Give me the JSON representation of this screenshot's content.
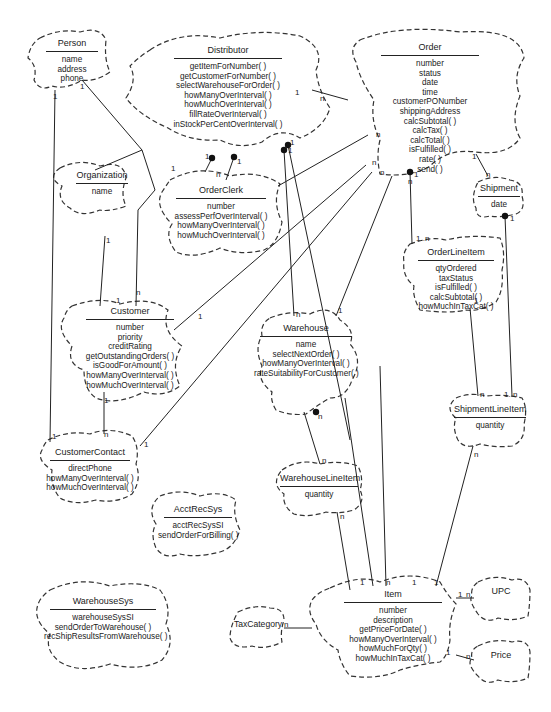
{
  "diagram": {
    "type": "class-diagram-clouds",
    "classes": {
      "person": {
        "name": "Person",
        "members": [
          "name",
          "address",
          "phone"
        ]
      },
      "distributor": {
        "name": "Distributor",
        "members": [
          "getItemForNumber( )",
          "getCustomerForNumber( )",
          "selectWarehouseForOrder( )",
          "howManyOverInterval( )",
          "howMuchOverInterval( )",
          "fillRateOverInterval( )",
          "inStockPerCentOverInterval( )"
        ]
      },
      "order": {
        "name": "Order",
        "members": [
          "number",
          "status",
          "date",
          "time",
          "customerPONumber",
          "shippingAddress",
          "calcSubtotal( )",
          "calcTax( )",
          "calcTotal( )",
          "isFulfilled( )",
          "rate( )",
          "send( )"
        ]
      },
      "organization": {
        "name": "Organization",
        "members": [
          "name"
        ]
      },
      "orderclerk": {
        "name": "OrderClerk",
        "members": [
          "number",
          "assessPerfOverInterval( )",
          "howManyOverInterval( )",
          "howMuchOverInterval( )"
        ]
      },
      "shipment": {
        "name": "Shipment",
        "members": [
          "date"
        ]
      },
      "orderlineitem": {
        "name": "OrderLineItem",
        "members": [
          "qtyOrdered",
          "taxStatus",
          "isFulfilled( )",
          "calcSubtotal( )",
          "howMuchInTaxCat( )"
        ]
      },
      "customer": {
        "name": "Customer",
        "members": [
          "number",
          "priority",
          "creditRating",
          "getOutstandingOrders( )",
          "isGoodForAmount( )",
          "howManyOverInterval( )",
          "howMuchOverInterval( )"
        ]
      },
      "warehouse": {
        "name": "Warehouse",
        "members": [
          "name",
          "selectNextOrder( )",
          "howManyOverInterval( )",
          "rateSuitabilityForCustomer( )"
        ]
      },
      "shipmentlineitem": {
        "name": "ShipmentLineItem",
        "members": [
          "quantity"
        ]
      },
      "customercontact": {
        "name": "CustomerContact",
        "members": [
          "directPhone",
          "howManyOverInterval( )",
          "howMuchOverInterval( )"
        ]
      },
      "warehouselineitem": {
        "name": "WarehouseLineItem",
        "members": [
          "quantity"
        ]
      },
      "acctrecsys": {
        "name": "AcctRecSys",
        "members": [
          "acctRecSysSI",
          "sendOrderForBilling( )"
        ]
      },
      "warehousesys": {
        "name": "WarehouseSys",
        "members": [
          "warehouseSysSI",
          "sendOrderToWarehouse( )",
          "recShipResultsFromWarehouse( )"
        ]
      },
      "item": {
        "name": "Item",
        "members": [
          "number",
          "description",
          "getPriceForDate( )",
          "howManyOverInterval( )",
          "howMuchForQty( )",
          "howMuchInTaxCat( )"
        ]
      },
      "taxcategory": {
        "name": "TaxCategory",
        "members": []
      },
      "upc": {
        "name": "UPC",
        "members": []
      },
      "price": {
        "name": "Price",
        "members": []
      }
    },
    "multiplicities": {
      "m1": "1",
      "m2": "1",
      "m3": "1",
      "m4": "n",
      "m5": "1",
      "m6": "1",
      "m7": "1",
      "m8": "n",
      "m9": "1",
      "m10": "1",
      "m11": "n",
      "m12": "n",
      "m13": "n",
      "m14": "n",
      "m15": "1",
      "m16": "n",
      "m17": "1",
      "m18": "1..n",
      "m19": "1",
      "m20": "1",
      "m21": "n",
      "m22": "1",
      "m23": "1",
      "m24": "n",
      "m25": "1",
      "m26": "1",
      "m27": "n",
      "m28": "1..n",
      "m29": "1",
      "m30": "n",
      "m31": "1",
      "m32": "n",
      "m33": "n",
      "m34": "1",
      "m35": "n",
      "m36": "1",
      "m37": "1",
      "m38": "n",
      "m39": "n",
      "m40": "1",
      "m41": "n",
      "m42": "1",
      "m43": "n",
      "m44": "1",
      "m45": "n"
    }
  }
}
